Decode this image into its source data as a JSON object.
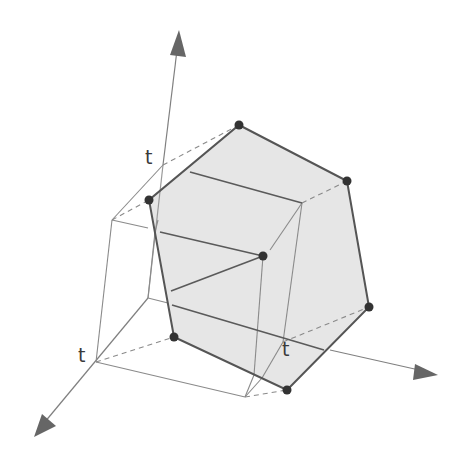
{
  "figure": {
    "colors": {
      "fill": "#e6e6e6",
      "edge": "#555555",
      "light_line": "#8a8a8a",
      "vertex": "#333333",
      "axis": "#777777",
      "arrow": "#666666"
    },
    "labels": {
      "t_z": "t",
      "t_x": "t",
      "t_y": "t"
    },
    "vertices": [
      {
        "name": "top",
        "x": 239,
        "y": 125
      },
      {
        "name": "upper-right",
        "x": 347,
        "y": 181
      },
      {
        "name": "right",
        "x": 369,
        "y": 307
      },
      {
        "name": "bottom",
        "x": 287,
        "y": 390
      },
      {
        "name": "lower-left",
        "x": 174,
        "y": 337
      },
      {
        "name": "left",
        "x": 149,
        "y": 200
      },
      {
        "name": "inner",
        "x": 263,
        "y": 256
      }
    ],
    "axes": [
      {
        "name": "z-axis",
        "from": [
          148,
          298
        ],
        "to": [
          179,
          32
        ]
      },
      {
        "name": "x-axis",
        "from": [
          148,
          298
        ],
        "to": [
          36,
          432
        ]
      },
      {
        "name": "y-axis",
        "from": [
          285,
          345
        ],
        "to": [
          436,
          374
        ]
      }
    ]
  }
}
